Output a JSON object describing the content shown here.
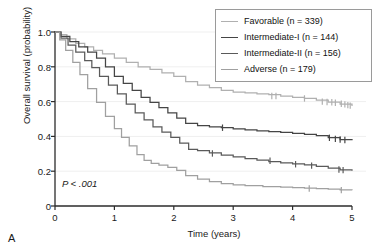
{
  "figure": {
    "panel_label": "A",
    "pvalue_text": "P < .001"
  },
  "chart_data": {
    "type": "line",
    "title": "",
    "xlabel": "Time (years)",
    "ylabel": "Overall survival (probability)",
    "xlim": [
      0,
      5
    ],
    "ylim": [
      0,
      1.0
    ],
    "xticks": [
      "0",
      "1",
      "2",
      "3",
      "4",
      "5"
    ],
    "xtick_values": [
      0,
      1,
      2,
      3,
      4,
      5
    ],
    "yticks": [
      "0",
      "0.2",
      "0.4",
      "0.6",
      "0.8",
      "1.0"
    ],
    "ytick_values": [
      0,
      0.2,
      0.4,
      0.6,
      0.8,
      1.0
    ],
    "grid": "horizontal-faint",
    "legend_position": "top-right",
    "annotations": [
      {
        "text": "P < .001",
        "x": 0.25,
        "y": 0.055
      }
    ],
    "series": [
      {
        "name": "Favorable",
        "label": "Favorable (n = 339)",
        "n": 339,
        "color": "#b0b0b0",
        "x": [
          0,
          0.08,
          0.2,
          0.35,
          0.5,
          0.65,
          0.8,
          1.0,
          1.2,
          1.4,
          1.6,
          1.8,
          2.0,
          2.2,
          2.4,
          2.6,
          2.8,
          3.0,
          3.2,
          3.4,
          3.6,
          3.8,
          4.0,
          4.2,
          4.4,
          4.6,
          4.8,
          5.0
        ],
        "y": [
          1.0,
          0.985,
          0.96,
          0.935,
          0.915,
          0.895,
          0.875,
          0.85,
          0.825,
          0.8,
          0.785,
          0.765,
          0.745,
          0.715,
          0.695,
          0.68,
          0.665,
          0.655,
          0.65,
          0.645,
          0.64,
          0.632,
          0.625,
          0.618,
          0.608,
          0.597,
          0.585,
          0.575
        ],
        "censor_x": [
          3.65,
          3.72,
          4.2,
          4.5,
          4.58,
          4.66,
          4.72,
          4.82,
          4.88,
          4.93,
          4.97
        ],
        "censor_y": [
          0.632,
          0.632,
          0.618,
          0.6,
          0.598,
          0.596,
          0.593,
          0.588,
          0.584,
          0.58,
          0.577
        ]
      },
      {
        "name": "Intermediate-I",
        "label": "Intermediate-I (n = 144)",
        "n": 144,
        "color": "#454545",
        "x": [
          0,
          0.1,
          0.25,
          0.4,
          0.55,
          0.7,
          0.85,
          1.0,
          1.15,
          1.3,
          1.45,
          1.6,
          1.75,
          1.9,
          2.05,
          2.2,
          2.4,
          2.6,
          2.8,
          3.0,
          3.2,
          3.4,
          3.6,
          3.8,
          4.0,
          4.2,
          4.4,
          4.6,
          4.8,
          5.0
        ],
        "y": [
          1.0,
          0.975,
          0.945,
          0.915,
          0.885,
          0.85,
          0.8,
          0.745,
          0.705,
          0.665,
          0.625,
          0.595,
          0.565,
          0.535,
          0.505,
          0.475,
          0.462,
          0.455,
          0.45,
          0.443,
          0.437,
          0.432,
          0.427,
          0.423,
          0.418,
          0.412,
          0.405,
          0.393,
          0.382,
          0.378
        ],
        "censor_x": [
          2.82,
          4.62,
          4.72,
          4.8,
          4.88
        ],
        "censor_y": [
          0.45,
          0.392,
          0.386,
          0.382,
          0.379
        ]
      },
      {
        "name": "Intermediate-II",
        "label": "Intermediate-II (n = 156)",
        "n": 156,
        "color": "#5a5a5a",
        "x": [
          0,
          0.1,
          0.22,
          0.35,
          0.5,
          0.62,
          0.75,
          0.9,
          1.05,
          1.2,
          1.35,
          1.5,
          1.65,
          1.8,
          1.95,
          2.1,
          2.25,
          2.4,
          2.6,
          2.8,
          3.0,
          3.2,
          3.4,
          3.6,
          3.8,
          4.0,
          4.2,
          4.4,
          4.6,
          4.8,
          5.0
        ],
        "y": [
          1.0,
          0.965,
          0.925,
          0.885,
          0.835,
          0.795,
          0.745,
          0.695,
          0.645,
          0.585,
          0.535,
          0.495,
          0.455,
          0.425,
          0.395,
          0.362,
          0.325,
          0.318,
          0.305,
          0.292,
          0.282,
          0.272,
          0.263,
          0.255,
          0.248,
          0.242,
          0.236,
          0.228,
          0.218,
          0.208,
          0.203
        ],
        "censor_x": [
          2.65,
          3.62,
          4.05,
          4.32,
          4.78,
          4.85
        ],
        "censor_y": [
          0.302,
          0.26,
          0.24,
          0.232,
          0.21,
          0.206
        ]
      },
      {
        "name": "Adverse",
        "label": "Adverse (n = 179)",
        "n": 179,
        "color": "#a0a0a0",
        "x": [
          0,
          0.08,
          0.18,
          0.3,
          0.42,
          0.55,
          0.7,
          0.85,
          1.0,
          1.12,
          1.25,
          1.38,
          1.5,
          1.62,
          1.75,
          1.9,
          2.05,
          2.2,
          2.4,
          2.6,
          2.8,
          3.0,
          3.2,
          3.5,
          3.8,
          4.0,
          4.2,
          4.4,
          4.6,
          4.8,
          5.0
        ],
        "y": [
          1.0,
          0.955,
          0.895,
          0.825,
          0.755,
          0.675,
          0.595,
          0.515,
          0.445,
          0.395,
          0.345,
          0.295,
          0.262,
          0.245,
          0.235,
          0.222,
          0.205,
          0.175,
          0.155,
          0.14,
          0.128,
          0.122,
          0.117,
          0.112,
          0.108,
          0.105,
          0.103,
          0.1,
          0.097,
          0.092,
          0.09
        ],
        "censor_x": [
          4.28,
          4.82
        ],
        "censor_y": [
          0.101,
          0.091
        ]
      }
    ]
  },
  "legend": {
    "items": [
      {
        "label": "Favorable (n = 339)",
        "color": "#b0b0b0"
      },
      {
        "label": "Intermediate-I (n = 144)",
        "color": "#454545"
      },
      {
        "label": "Intermediate-II (n = 156)",
        "color": "#5a5a5a"
      },
      {
        "label": "Adverse (n = 179)",
        "color": "#a0a0a0"
      }
    ]
  }
}
